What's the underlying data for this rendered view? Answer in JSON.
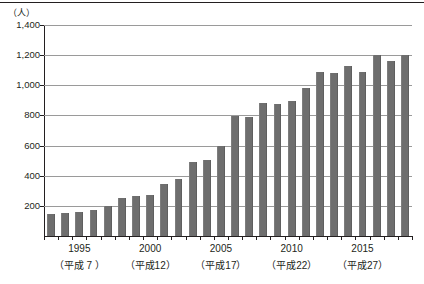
{
  "chart_data": {
    "type": "bar",
    "title": "",
    "subtitle": "",
    "xlabel": "",
    "ylabel": "（人）",
    "yunit": "（人）",
    "ylim": [
      0,
      1400
    ],
    "ytick_values": [
      1400,
      1200,
      1000,
      800,
      600,
      400,
      200
    ],
    "ytick_labels": [
      "1,400",
      "1,200",
      "1,000",
      "800",
      "600",
      "400",
      "200"
    ],
    "grid": true,
    "legend": "none",
    "bar_color": "#6e6e6e",
    "axis_color": "#231f20",
    "grid_color": "#9a9a9a",
    "categories": [
      "1993",
      "1994",
      "1995",
      "1996",
      "1997",
      "1998",
      "1999",
      "2000",
      "2001",
      "2002",
      "2003",
      "2004",
      "2005",
      "2006",
      "2007",
      "2008",
      "2009",
      "2010",
      "2011",
      "2012",
      "2013",
      "2014",
      "2015",
      "2016",
      "2017",
      "2018"
    ],
    "values": [
      145,
      150,
      160,
      175,
      200,
      255,
      265,
      270,
      345,
      380,
      490,
      505,
      600,
      795,
      790,
      880,
      875,
      895,
      980,
      1085,
      1080,
      1130,
      1090,
      1200,
      1160,
      1200
    ],
    "xtick_labels": [
      {
        "year": "1995",
        "era": "（平成 7 ）",
        "index": 2
      },
      {
        "year": "2000",
        "era": "（平成12）",
        "index": 7
      },
      {
        "year": "2005",
        "era": "（平成17）",
        "index": 12
      },
      {
        "year": "2010",
        "era": "（平成22）",
        "index": 17
      },
      {
        "year": "2015",
        "era": "（平成27）",
        "index": 22
      }
    ]
  }
}
